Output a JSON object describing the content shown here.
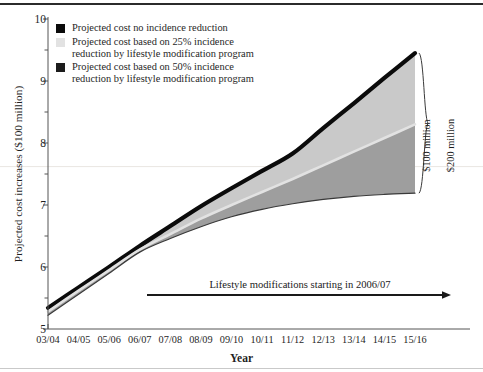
{
  "chart_data": {
    "type": "area",
    "title": "",
    "xlabel": "Year",
    "ylabel": "Projected cost increases ($100 million)",
    "categories": [
      "03/04",
      "04/05",
      "05/06",
      "06/07",
      "07/08",
      "08/09",
      "09/10",
      "10/11",
      "11/12",
      "12/13",
      "13/14",
      "14/15",
      "15/16"
    ],
    "ylim": [
      5,
      10
    ],
    "ytick_labels": [
      "5",
      "6",
      "7",
      "8",
      "9",
      "10"
    ],
    "ytick_values": [
      5,
      6,
      7,
      8,
      9,
      10
    ],
    "minor_ytick_values": [
      5.5,
      6.5,
      7.5,
      8.5,
      9.5
    ],
    "grid": false,
    "legend_position": "upper-left",
    "series": [
      {
        "name": "Projected cost no incidence reduction",
        "color": "#0b0b0b",
        "values": [
          5.34,
          5.67,
          6.0,
          6.34,
          6.66,
          6.98,
          7.27,
          7.55,
          7.83,
          8.24,
          8.64,
          9.05,
          9.45
        ]
      },
      {
        "name": "Projected cost based on 25% incidence reduction by lifestyle modification program",
        "color": "#e2e2e2",
        "values": [
          5.28,
          5.62,
          5.95,
          6.28,
          6.53,
          6.78,
          7.0,
          7.21,
          7.42,
          7.64,
          7.86,
          8.08,
          8.3
        ]
      },
      {
        "name": "Projected cost based on 50% incidence reduction by lifestyle modification program",
        "color": "#9e9e9e",
        "values": [
          5.22,
          5.56,
          5.9,
          6.24,
          6.46,
          6.65,
          6.81,
          6.93,
          7.02,
          7.09,
          7.14,
          7.17,
          7.19
        ]
      }
    ],
    "band_fills": {
      "upper_band": "#c9c9c9",
      "lower_band": "#9e9e9e"
    },
    "annotations": [
      {
        "id": "ann-100",
        "text": "$100 million",
        "rotated": true
      },
      {
        "id": "ann-200",
        "text": "$200 million",
        "rotated": true
      },
      {
        "id": "ann-lifestyle",
        "text": "Lifestyle modifications starting in 2006/07",
        "rotated": false
      }
    ]
  },
  "legend": {
    "items": [
      {
        "label": "Projected cost no incidence reduction",
        "color": "#0b0b0b"
      },
      {
        "label": "Projected cost based on 25% incidence\nreduction by lifestyle modification program",
        "color": "#e2e2e2"
      },
      {
        "label": "Projected cost based on 50% incidence\nreduction by lifestyle modification program",
        "color": "#1c1c1c"
      }
    ]
  },
  "axes": {
    "y_title": "Projected cost increases ($100 million)",
    "x_title": "Year",
    "ytick_labels": [
      "10",
      "9",
      "8",
      "7",
      "6",
      "5"
    ],
    "xtick_labels": [
      "03/04",
      "04/05",
      "05/06",
      "06/07",
      "07/08",
      "08/09",
      "09/10",
      "10/11",
      "11/12",
      "12/13",
      "13/14",
      "14/15",
      "15/16"
    ]
  },
  "annotations": {
    "hundred_million": "$100 million",
    "two_hundred_million": "$200 million",
    "lifestyle": "Lifestyle modifications starting in 2006/07"
  }
}
